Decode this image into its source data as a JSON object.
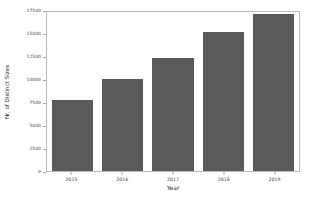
{
  "chart_data": {
    "type": "bar",
    "title": "",
    "xlabel": "Year",
    "ylabel": "Nr. of Distinct Sizes",
    "categories": [
      "2015",
      "2016",
      "2017",
      "2018",
      "2019"
    ],
    "values": [
      7700,
      9950,
      12300,
      15100,
      17100
    ],
    "series": [
      {
        "name": "Nr. of Distinct Sizes",
        "values": [
          7700,
          9950,
          12300,
          15100,
          17100
        ]
      }
    ],
    "ylim": [
      0,
      17500
    ],
    "yticks": [
      0,
      2500,
      5000,
      7500,
      10000,
      12500,
      15000,
      17500
    ],
    "ytick_labels": [
      "0",
      "2500",
      "5000",
      "7500",
      "10000",
      "12500",
      "15000",
      "17500"
    ],
    "xtick_labels": [
      "2015",
      "2016",
      "2017",
      "2018",
      "2019"
    ],
    "grid": false,
    "legend": null,
    "legend_position": "none",
    "bar_color": "#5a5a5a",
    "frame_color": "#b9b9b9",
    "background": "#ffffff"
  }
}
